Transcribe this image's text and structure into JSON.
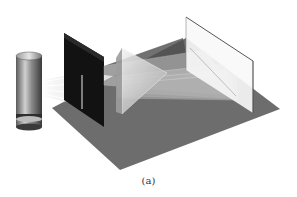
{
  "figure": {
    "caption": "(a)",
    "components": [
      {
        "name": "light-source",
        "description": "cylindrical lamp"
      },
      {
        "name": "slit-barrier",
        "description": "black panel with vertical slit"
      },
      {
        "name": "light-rays",
        "count": 4
      },
      {
        "name": "prism",
        "description": "triangular glass prism"
      },
      {
        "name": "dispersed-beams",
        "description": "stacked translucent fan of rays"
      },
      {
        "name": "screen",
        "description": "white vertical screen"
      },
      {
        "name": "floor",
        "description": "gray base plane"
      }
    ],
    "colors": {
      "floor": "#6b6b6b",
      "floor_shadow": "#4a4a4a",
      "slit_panel": "#111111",
      "screen": "#f8f8f8",
      "screen_edge": "#555555",
      "beam": "#bfbfbf",
      "prism": "#d8d8d8",
      "lamp_body": "#8a8a8a"
    }
  }
}
